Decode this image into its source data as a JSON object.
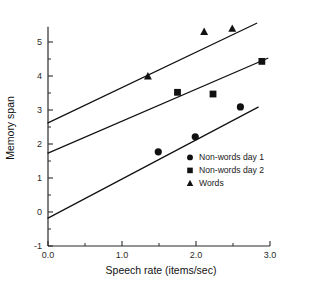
{
  "chart_data": {
    "type": "scatter",
    "title": "",
    "subtitle": "",
    "xlabel": "Speech rate (items/sec)",
    "ylabel": "Memory span",
    "xlim": [
      0.0,
      3.0
    ],
    "ylim": [
      -1,
      5.45
    ],
    "grid": false,
    "legend_position": "inside-lower-right",
    "x_ticks": [
      "0.0",
      "1.0",
      "2.0",
      "3.0"
    ],
    "x_tick_values": [
      0.0,
      1.0,
      2.0,
      3.0
    ],
    "x_minor_tick_values": [
      0.5,
      1.5,
      2.5
    ],
    "y_ticks": [
      "-1",
      "0",
      "1",
      "2",
      "3",
      "4",
      "5"
    ],
    "y_tick_values": [
      -1,
      0,
      1,
      2,
      3,
      4,
      5
    ],
    "y_minor_tick_values": [
      -0.5,
      0.5,
      1.5,
      2.5,
      3.5,
      4.5
    ],
    "series": [
      {
        "name": "Non-words day 1",
        "marker": "circle",
        "color": "#111111",
        "points": [
          {
            "x": 1.49,
            "y": 1.77
          },
          {
            "x": 1.99,
            "y": 2.21
          },
          {
            "x": 2.6,
            "y": 3.09
          }
        ],
        "fit_line": {
          "intercept": -0.18,
          "slope": 1.15,
          "x_start": 0.0,
          "x_end": 2.84
        }
      },
      {
        "name": "Non-words day 2",
        "marker": "square",
        "color": "#111111",
        "points": [
          {
            "x": 1.75,
            "y": 3.52
          },
          {
            "x": 2.23,
            "y": 3.47
          },
          {
            "x": 2.89,
            "y": 4.43
          }
        ],
        "fit_line": {
          "intercept": 1.73,
          "slope": 0.94,
          "x_start": 0.0,
          "x_end": 2.97
        }
      },
      {
        "name": "Words",
        "marker": "triangle",
        "color": "#111111",
        "points": [
          {
            "x": 1.35,
            "y": 3.99
          },
          {
            "x": 2.11,
            "y": 5.3
          },
          {
            "x": 2.49,
            "y": 5.39
          }
        ],
        "fit_line": {
          "intercept": 2.62,
          "slope": 1.04,
          "x_start": 0.0,
          "x_end": 2.82
        }
      }
    ],
    "legend_entries": [
      {
        "label": "Non-words day 1",
        "marker": "circle"
      },
      {
        "label": "Non-words day 2",
        "marker": "square"
      },
      {
        "label": "Words",
        "marker": "triangle"
      }
    ]
  }
}
